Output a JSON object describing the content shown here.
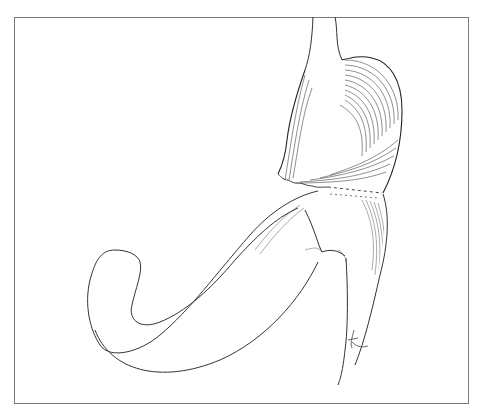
{
  "figure": {
    "elements": [
      "gastric-pouch",
      "esophagus",
      "staple-line",
      "anastomosis",
      "jejunal-loop",
      "jejunal-limb",
      "artist-signature"
    ],
    "line_color": "#333333",
    "frame_color": "#7a7a7a"
  },
  "caption": {
    "text": "",
    "note_visible": "caption text truncated at bottom edge; not legible"
  }
}
